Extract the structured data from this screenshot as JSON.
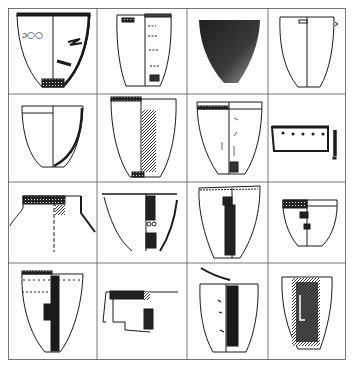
{
  "figure": {
    "type": "archaeological pottery plate",
    "layout": {
      "rows": 4,
      "cols": 4
    },
    "colors": {
      "ink": "#1a1a1a",
      "grid": "#555555",
      "paper": "#fdfdfd",
      "photo_dark": "#2a2a2a",
      "photo_light": "#9a9a9a"
    },
    "cells": [
      {
        "row": 1,
        "col": 1,
        "item": "vessel-drawing",
        "shape": "deep bowl, flaring, decorated rim, split section view"
      },
      {
        "row": 1,
        "col": 2,
        "item": "vessel-drawing",
        "shape": "tall cup with lug, incised motifs"
      },
      {
        "row": 1,
        "col": 3,
        "item": "vessel-photo",
        "shape": "dark conical bowl photograph"
      },
      {
        "row": 1,
        "col": 4,
        "item": "vessel-drawing",
        "shape": "plain cup with lug, section view"
      },
      {
        "row": 2,
        "col": 1,
        "item": "vessel-drawing",
        "shape": "plain bowl, section with rim band"
      },
      {
        "row": 2,
        "col": 2,
        "item": "vessel-drawing",
        "shape": "tall beaker, hatched decoration"
      },
      {
        "row": 2,
        "col": 3,
        "item": "vessel-drawing",
        "shape": "bowl with dotted rim band"
      },
      {
        "row": 2,
        "col": 4,
        "item": "sherd-drawing",
        "shape": "rim sherd with punctate decoration and profile"
      },
      {
        "row": 3,
        "col": 1,
        "item": "vessel-drawing",
        "shape": "jar neck with checkered band"
      },
      {
        "row": 3,
        "col": 2,
        "item": "vessel-drawing",
        "shape": "bowl with dark panel decoration"
      },
      {
        "row": 3,
        "col": 3,
        "item": "vessel-drawing",
        "shape": "beaker with dark stripe"
      },
      {
        "row": 3,
        "col": 4,
        "item": "vessel-drawing",
        "shape": "small cup with zigzag band"
      },
      {
        "row": 4,
        "col": 1,
        "item": "vessel-drawing",
        "shape": "beaker with dark vertical band and dotted rim"
      },
      {
        "row": 4,
        "col": 2,
        "item": "sherd-drawing",
        "shape": "fragment with dark stepped pattern"
      },
      {
        "row": 4,
        "col": 3,
        "item": "vessel-drawing",
        "shape": "beaker with dark stripe and arc sherd"
      },
      {
        "row": 4,
        "col": 4,
        "item": "vessel-drawing",
        "shape": "beaker with dark textured panel"
      }
    ]
  }
}
